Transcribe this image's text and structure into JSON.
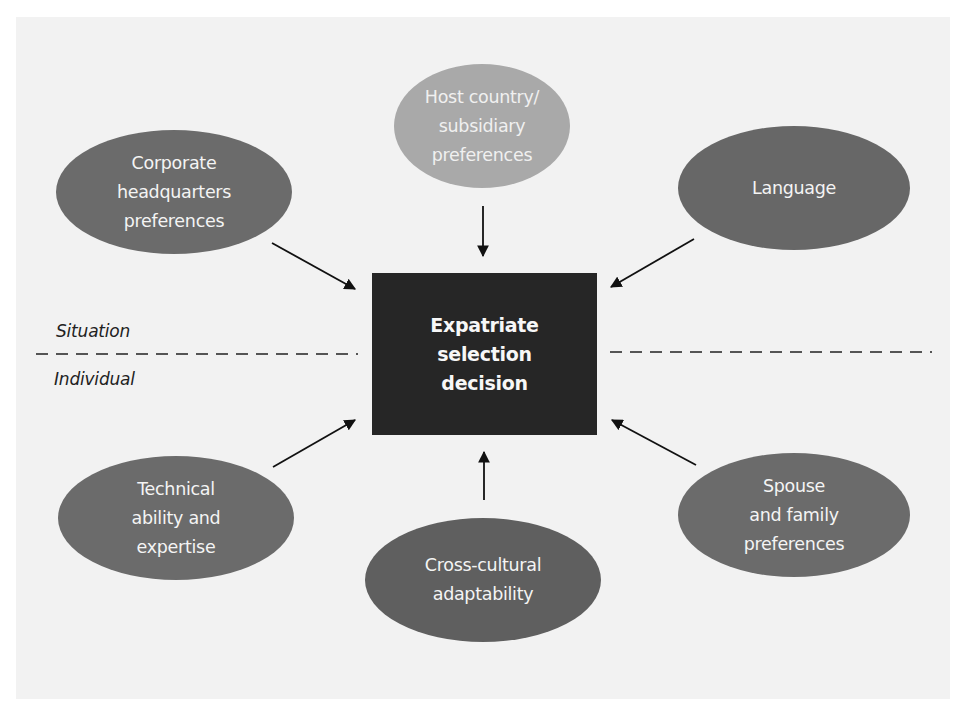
{
  "diagram": {
    "center": {
      "label": "Expatriate\nselection\ndecision",
      "color": "#262626"
    },
    "divider": {
      "top_label": "Situation",
      "bottom_label": "Individual"
    },
    "nodes": [
      {
        "id": "host",
        "label": "Host country/\nsubsidiary\npreferences",
        "group": "Situation",
        "color": "#a9a9a9"
      },
      {
        "id": "corporate",
        "label": "Corporate\nheadquarters\npreferences",
        "group": "Situation",
        "color": "#6b6b6b"
      },
      {
        "id": "language",
        "label": "Language",
        "group": "Situation",
        "color": "#676767"
      },
      {
        "id": "technical",
        "label": "Technical\nability and\nexpertise",
        "group": "Individual",
        "color": "#6b6b6b"
      },
      {
        "id": "crosscultural",
        "label": "Cross-cultural\nadaptability",
        "group": "Individual",
        "color": "#5f5f5f"
      },
      {
        "id": "spouse",
        "label": "Spouse\nand family\npreferences",
        "group": "Individual",
        "color": "#6b6b6b"
      }
    ],
    "edges": [
      {
        "from": "host",
        "to": "center"
      },
      {
        "from": "corporate",
        "to": "center"
      },
      {
        "from": "language",
        "to": "center"
      },
      {
        "from": "technical",
        "to": "center"
      },
      {
        "from": "crosscultural",
        "to": "center"
      },
      {
        "from": "spouse",
        "to": "center"
      }
    ],
    "colors": {
      "background": "#f2f2f2",
      "arrow": "#111111",
      "text_light": "#f4f4f4",
      "text_dark": "#222222"
    }
  }
}
